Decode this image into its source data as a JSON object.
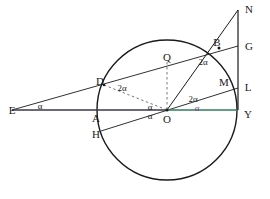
{
  "figure": {
    "background": "#ffffff",
    "stroke_color": "#1a1a1a",
    "accent_green": "#2e7d5b",
    "accent_purple": "#7a3f8f",
    "dash_color": "#555555",
    "circle": {
      "cx": 167,
      "cy": 110,
      "r": 70
    }
  },
  "points": [
    {
      "id": "E",
      "label": "E",
      "x": 12,
      "y": 110,
      "lx": 12,
      "ly": 110
    },
    {
      "id": "D",
      "label": "D",
      "x": 104,
      "y": 85,
      "lx": 100,
      "ly": 81
    },
    {
      "id": "Q",
      "label": "Q",
      "x": 167,
      "y": 62,
      "lx": 167,
      "ly": 57
    },
    {
      "id": "B",
      "label": "B",
      "x": 219,
      "y": 48,
      "lx": 217,
      "ly": 42
    },
    {
      "id": "N",
      "label": "N",
      "x": 238,
      "y": 10,
      "lx": 249,
      "ly": 9
    },
    {
      "id": "G",
      "label": "G",
      "x": 238,
      "y": 46,
      "lx": 249,
      "ly": 46
    },
    {
      "id": "M",
      "label": "M",
      "x": 226,
      "y": 86,
      "lx": 224,
      "ly": 82
    },
    {
      "id": "L",
      "label": "L",
      "x": 238,
      "y": 88,
      "lx": 248,
      "ly": 87
    },
    {
      "id": "Y",
      "label": "Y",
      "x": 238,
      "y": 110,
      "lx": 248,
      "ly": 114
    },
    {
      "id": "O",
      "label": "O",
      "x": 167,
      "y": 110,
      "lx": 167,
      "ly": 119
    },
    {
      "id": "A",
      "label": "A",
      "x": 99,
      "y": 110,
      "lx": 96,
      "ly": 118
    },
    {
      "id": "H",
      "label": "H",
      "x": 101,
      "y": 131,
      "lx": 96,
      "ly": 134
    }
  ],
  "angles": [
    {
      "id": "alpha-at-E",
      "text": "α",
      "x": 40,
      "y": 106,
      "color": "#1a1a1a"
    },
    {
      "id": "twoalpha-at-D",
      "text": "2α",
      "x": 122,
      "y": 88,
      "color": "#1a1a1a"
    },
    {
      "id": "twoalpha-at-B",
      "text": "2α",
      "x": 203,
      "y": 62,
      "color": "#1a1a1a"
    },
    {
      "id": "twoalpha-at-O-up",
      "text": "2α",
      "x": 193,
      "y": 99,
      "color": "#1a1a1a"
    },
    {
      "id": "alpha-at-O-upleft",
      "text": "α",
      "x": 150,
      "y": 107,
      "color": "#1a1a1a"
    },
    {
      "id": "alpha-at-O-left",
      "text": "α",
      "x": 150,
      "y": 116,
      "color": "#1a1a1a"
    },
    {
      "id": "alpha-at-O-right",
      "text": "α",
      "x": 197,
      "y": 108,
      "color": "#7a3f8f"
    }
  ],
  "segments": [
    {
      "id": "line-E-to-G",
      "from": "E",
      "to": "G",
      "style": "solid",
      "color": "#1a1a1a"
    },
    {
      "id": "line-H-to-L",
      "from": "H",
      "to": "L",
      "style": "solid",
      "color": "#1a1a1a"
    },
    {
      "id": "line-E-to-O",
      "from": "E",
      "to": "O",
      "style": "solid",
      "color": "#1a1a1a"
    },
    {
      "id": "line-O-to-Y",
      "from": "O",
      "to": "Y",
      "style": "solid",
      "color": "#2e7d5b"
    },
    {
      "id": "line-O-to-N",
      "from": "O",
      "to": "N",
      "style": "solid",
      "color": "#1a1a1a"
    },
    {
      "id": "line-N-to-Y",
      "from": "N",
      "to": "Y",
      "style": "solid",
      "color": "#1a1a1a"
    },
    {
      "id": "line-D-to-O",
      "from": "D",
      "to": "O",
      "style": "dashed",
      "color": "#555555"
    },
    {
      "id": "line-Q-to-O",
      "from": "Q",
      "to": "O",
      "style": "dashed",
      "color": "#555555"
    }
  ]
}
